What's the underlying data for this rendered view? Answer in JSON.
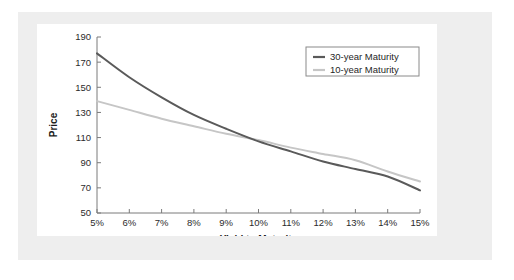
{
  "figure": {
    "background_color": "#ffffff",
    "mat_color": "#eeeeee",
    "card_color": "#ffffff"
  },
  "chart_data": {
    "type": "line",
    "title": "",
    "xlabel": "Yield to Maturity",
    "ylabel": "Price",
    "xlim": [
      5,
      15
    ],
    "ylim": [
      50,
      190
    ],
    "grid": false,
    "legend_position": "top-right",
    "x_tick_labels": [
      "5%",
      "6%",
      "7%",
      "8%",
      "9%",
      "10%",
      "11%",
      "12%",
      "13%",
      "14%",
      "15%"
    ],
    "x": [
      5,
      6,
      7,
      8,
      9,
      10,
      11,
      12,
      13,
      14,
      15
    ],
    "y_tick_labels": [
      "50",
      "70",
      "90",
      "110",
      "130",
      "150",
      "170",
      "190"
    ],
    "y_ticks": [
      50,
      70,
      90,
      110,
      130,
      150,
      170,
      190
    ],
    "series": [
      {
        "name": "30-year Maturity",
        "color": "#5a5a5a",
        "values": [
          177,
          158,
          142,
          128,
          117,
          107,
          99,
          91,
          85,
          79,
          68
        ]
      },
      {
        "name": "10-year Maturity",
        "color": "#c6c6c6",
        "values": [
          139,
          132,
          125,
          119,
          113,
          108,
          102,
          97,
          92,
          83,
          75
        ]
      }
    ],
    "legend_entries": [
      {
        "label": "30-year Maturity",
        "color": "#5a5a5a"
      },
      {
        "label": "10-year Maturity",
        "color": "#c6c6c6"
      }
    ]
  },
  "axis_colors": {
    "axis_stroke": "#7b7b7b",
    "tick_text": "#2b2b2b",
    "title_text": "#1a1a1a",
    "legend_border": "#8a8a8a"
  }
}
